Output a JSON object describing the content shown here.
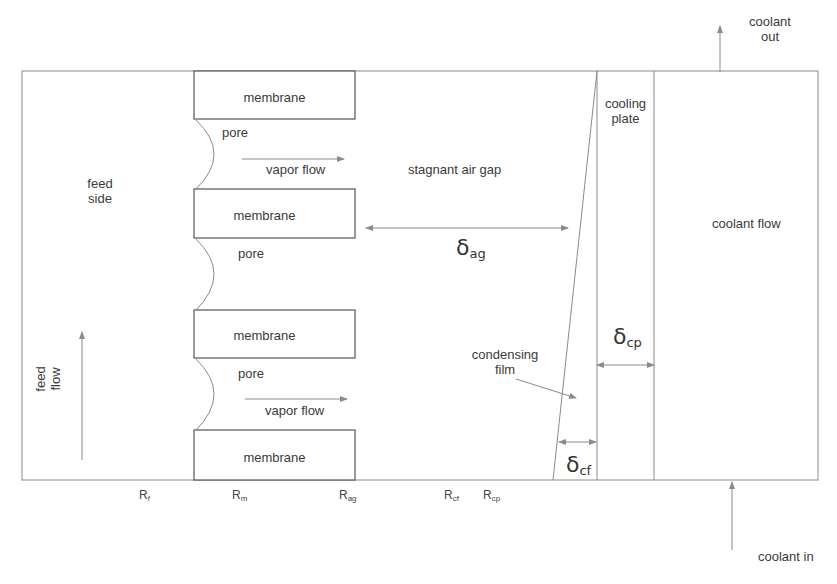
{
  "colors": {
    "line": "#8a8a8a",
    "box": "#555555",
    "text": "#3a3a3a",
    "arrow": "#8a8a8a"
  },
  "regions": {
    "feed_side": "feed\nside",
    "feed_side_l1": "feed",
    "feed_side_l2": "side",
    "feed_flow_l1": "feed",
    "feed_flow_l2": "flow",
    "air_gap": "stagnant air gap",
    "cooling_plate_l1": "cooling",
    "cooling_plate_l2": "plate",
    "coolant_flow": "coolant flow",
    "condensing_film_l1": "condensing",
    "condensing_film_l2": "film"
  },
  "membranes": [
    {
      "label": "membrane"
    },
    {
      "label": "membrane"
    },
    {
      "label": "membrane"
    },
    {
      "label": "membrane"
    }
  ],
  "pores": [
    {
      "label": "pore"
    },
    {
      "label": "pore"
    },
    {
      "label": "pore"
    }
  ],
  "vapor_flows": [
    {
      "label": "vapor flow"
    },
    {
      "label": "vapor flow"
    }
  ],
  "thicknesses": {
    "air_gap": {
      "symbol": "δ",
      "sub": "ag"
    },
    "cooling_plate": {
      "symbol": "δ",
      "sub": "cp"
    },
    "condensing_film": {
      "symbol": "δ",
      "sub": "cf"
    }
  },
  "resistances": [
    {
      "symbol": "R",
      "sub": "f"
    },
    {
      "symbol": "R",
      "sub": "m"
    },
    {
      "symbol": "R",
      "sub": "ag"
    },
    {
      "symbol": "R",
      "sub": "cf"
    },
    {
      "symbol": "R",
      "sub": "cp"
    }
  ],
  "coolant": {
    "out_l1": "coolant",
    "out_l2": "out",
    "in": "coolant in"
  }
}
